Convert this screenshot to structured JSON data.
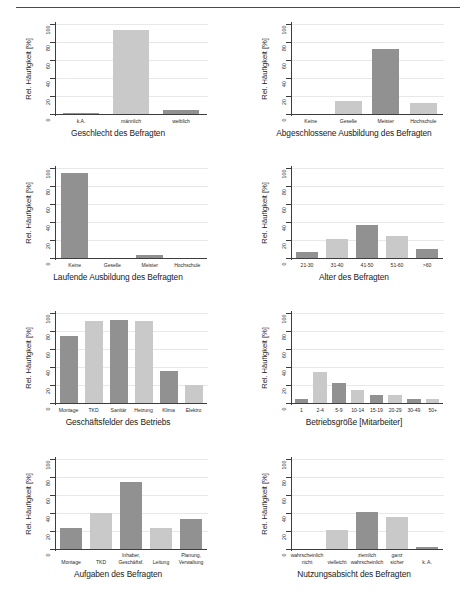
{
  "page": {
    "background": "#ffffff",
    "axis_color": "#3d3d3d",
    "grid_color": "#e8e8e8",
    "bar_color_dark": "#919191",
    "bar_color_light": "#c9c9c9",
    "shared_ylabel": "Rel. Häufigkeit [%]",
    "y_ticks": [
      "0",
      "20",
      "40",
      "60",
      "80",
      "100"
    ],
    "y_ticks_values": [
      0,
      20,
      40,
      60,
      80,
      100
    ]
  },
  "chart_data": [
    {
      "id": "geschlecht",
      "type": "bar",
      "title": "",
      "xlabel": "Geschlecht des Befragten",
      "ylabel": "Rel. Häufigkeit [%]",
      "ylim": [
        0,
        100
      ],
      "grid": true,
      "categories": [
        "k.A.",
        "männlich",
        "weiblich"
      ],
      "values": [
        1,
        93,
        4
      ],
      "colors": [
        "#919191",
        "#c9c9c9",
        "#919191"
      ]
    },
    {
      "id": "abgeschlossene-ausbildung",
      "type": "bar",
      "title": "",
      "xlabel": "Abgeschlossene Ausbildung des Befragten",
      "ylabel": "Rel. Häufigkeit [%]",
      "ylim": [
        0,
        100
      ],
      "grid": true,
      "categories": [
        "Keine",
        "Geselle",
        "Meister",
        "Hochschule"
      ],
      "values": [
        0,
        15,
        72,
        12
      ],
      "colors": [
        "#919191",
        "#c9c9c9",
        "#919191",
        "#c9c9c9"
      ]
    },
    {
      "id": "laufende-ausbildung",
      "type": "bar",
      "title": "",
      "xlabel": "Laufende Ausbildung des Befragten",
      "ylabel": "Rel. Häufigkeit [%]",
      "ylim": [
        0,
        100
      ],
      "grid": true,
      "categories": [
        "Keine",
        "Geselle",
        "Meister",
        "Hochschule"
      ],
      "values": [
        95,
        0,
        3,
        0
      ],
      "colors": [
        "#919191",
        "#c9c9c9",
        "#919191",
        "#c9c9c9"
      ]
    },
    {
      "id": "alter",
      "type": "bar",
      "title": "",
      "xlabel": "Alter des Befragten",
      "ylabel": "Rel. Häufigkeit [%]",
      "ylim": [
        0,
        100
      ],
      "grid": true,
      "categories": [
        "21-30",
        "31-40",
        "41-50",
        "51-60",
        ">60"
      ],
      "values": [
        7,
        21,
        37,
        25,
        9.5
      ],
      "colors": [
        "#919191",
        "#c9c9c9",
        "#919191",
        "#c9c9c9",
        "#919191"
      ]
    },
    {
      "id": "geschaeftsfelder",
      "type": "bar",
      "title": "",
      "xlabel": "Geschäftsfelder des Betriebs",
      "ylabel": "Rel. Häufigkeit [%]",
      "ylim": [
        0,
        100
      ],
      "grid": true,
      "categories": [
        "Montage",
        "TKD",
        "Sanitär",
        "Heizung",
        "Klima",
        "Elektro"
      ],
      "values": [
        75,
        91,
        92,
        91,
        36,
        20
      ],
      "colors": [
        "#919191",
        "#c9c9c9",
        "#919191",
        "#c9c9c9",
        "#919191",
        "#c9c9c9"
      ]
    },
    {
      "id": "betriebsgroesse",
      "type": "bar",
      "title": "",
      "xlabel": "Betriebsgröße [Mitarbeiter]",
      "ylabel": "Rel. Häufigkeit [%]",
      "ylim": [
        0,
        100
      ],
      "grid": true,
      "categories": [
        "1",
        "2-4",
        "5-9",
        "10-14",
        "15-19",
        "20-29",
        "30-49",
        "50+"
      ],
      "values": [
        5,
        34,
        22,
        15,
        8.5,
        9,
        4,
        5
      ],
      "colors": [
        "#919191",
        "#c9c9c9",
        "#919191",
        "#c9c9c9",
        "#919191",
        "#c9c9c9",
        "#919191",
        "#c9c9c9"
      ]
    },
    {
      "id": "aufgaben",
      "type": "bar",
      "title": "",
      "xlabel": "Aufgaben des Befragten",
      "ylabel": "Rel. Häufigkeit [%]",
      "ylim": [
        0,
        100
      ],
      "grid": true,
      "categories": [
        "Montage",
        "TKD",
        "Inhaber, Geschäftsf.",
        "Leitung",
        "Planung, Verwaltung"
      ],
      "category_lines": [
        [
          "Montage"
        ],
        [
          "TKD"
        ],
        [
          "Inhaber,",
          "Geschäftsf."
        ],
        [
          "Leitung"
        ],
        [
          "Planung,",
          "Verwaltung"
        ]
      ],
      "values": [
        23,
        40,
        74,
        23,
        33
      ],
      "colors": [
        "#919191",
        "#c9c9c9",
        "#919191",
        "#c9c9c9",
        "#919191"
      ]
    },
    {
      "id": "nutzungsabsicht",
      "type": "bar",
      "title": "",
      "xlabel": "Nutzungsabsicht des Befragten",
      "ylabel": "Rel. Häufigkeit [%]",
      "ylim": [
        0,
        100
      ],
      "grid": true,
      "categories": [
        "wahrscheinlich nicht",
        "vielleicht",
        "ziemlich wahrscheinlich",
        "ganz sicher",
        "k. A."
      ],
      "category_lines": [
        [
          "wahrscheinlich",
          "nicht"
        ],
        [
          "vielleicht"
        ],
        [
          "ziemlich",
          "wahrscheinlich"
        ],
        [
          "ganz",
          "sicher"
        ],
        [
          "k. A."
        ]
      ],
      "values": [
        0,
        21,
        41,
        36,
        2
      ],
      "colors": [
        "#919191",
        "#c9c9c9",
        "#919191",
        "#c9c9c9",
        "#919191"
      ]
    }
  ]
}
